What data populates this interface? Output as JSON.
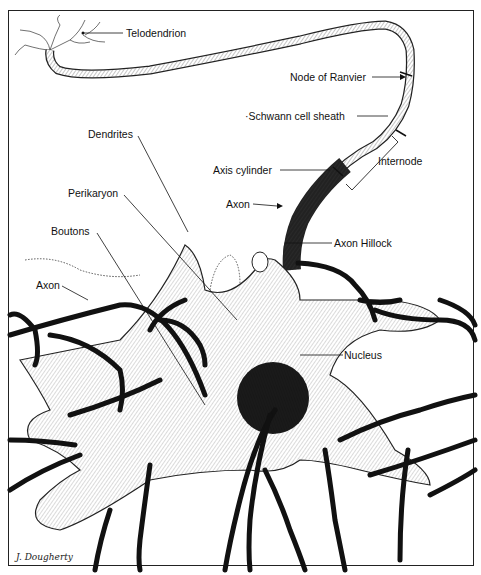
{
  "diagram": {
    "labels": {
      "telodendrion": "Telodendrion",
      "node_of_ranvier": "Node of Ranvier",
      "schwann": "·Schwann cell sheath",
      "dendrites": "Dendrites",
      "internode": "Internode",
      "axis_cylinder": "Axis cylinder",
      "perikaryon": "Perikaryon",
      "axon_top": "Axon",
      "boutons": "Boutons",
      "axon_hillock": "Axon Hillock",
      "axon_left": "Axon",
      "nucleus": "Nucleus"
    },
    "signature": "J. Dougherty"
  }
}
